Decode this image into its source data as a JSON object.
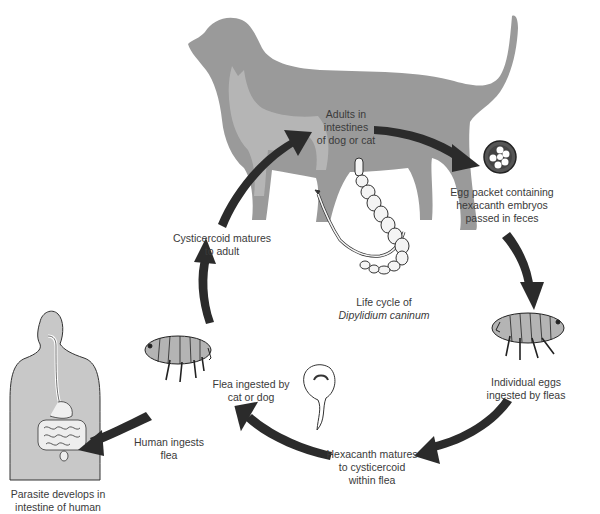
{
  "diagram": {
    "type": "life-cycle",
    "title": {
      "line1": "Life cycle of",
      "line2": "Dipylidium caninum"
    },
    "colors": {
      "arrow": "#2b2b2b",
      "silhouette": "#9a9a9a",
      "human_body": "#c8c8c8",
      "flea_fill": "#b4b4b4",
      "text": "#3a3a3a",
      "background": "#ffffff"
    },
    "stages": [
      {
        "id": "adults",
        "line1": "Adults in",
        "line2": "intestines",
        "line3": "of dog or cat",
        "icon": "tapeworm-icon"
      },
      {
        "id": "egg-packet",
        "line1": "Egg packet containing",
        "line2": "hexacanth embryos",
        "line3": "passed in feces",
        "icon": "egg-packet-icon"
      },
      {
        "id": "eggs-ingested",
        "line1": "Individual eggs",
        "line2": "ingested by fleas",
        "icon": "flea-icon"
      },
      {
        "id": "hexacanth",
        "line1": "Hexacanth matures",
        "line2": "to cysticercoid",
        "line3": "within flea",
        "icon": "cysticercoid-icon"
      },
      {
        "id": "flea-ingested",
        "line1": "Flea ingested by",
        "line2": "cat or dog",
        "icon": "flea-icon"
      },
      {
        "id": "cysticercoid",
        "line1": "Cysticercoid matures",
        "line2": "to adult"
      },
      {
        "id": "human-ingests",
        "line1": "Human ingests",
        "line2": "flea"
      },
      {
        "id": "human-parasite",
        "line1": "Parasite develops in",
        "line2": "intestine of human",
        "icon": "human-body-icon"
      }
    ],
    "edges": [
      {
        "from": "cysticercoid",
        "to": "adults"
      },
      {
        "from": "adults",
        "to": "egg-packet"
      },
      {
        "from": "egg-packet",
        "to": "eggs-ingested"
      },
      {
        "from": "eggs-ingested",
        "to": "hexacanth"
      },
      {
        "from": "hexacanth",
        "to": "flea-ingested"
      },
      {
        "from": "flea-ingested",
        "to": "cysticercoid"
      },
      {
        "from": "human-ingests",
        "to": "human-parasite"
      }
    ]
  }
}
